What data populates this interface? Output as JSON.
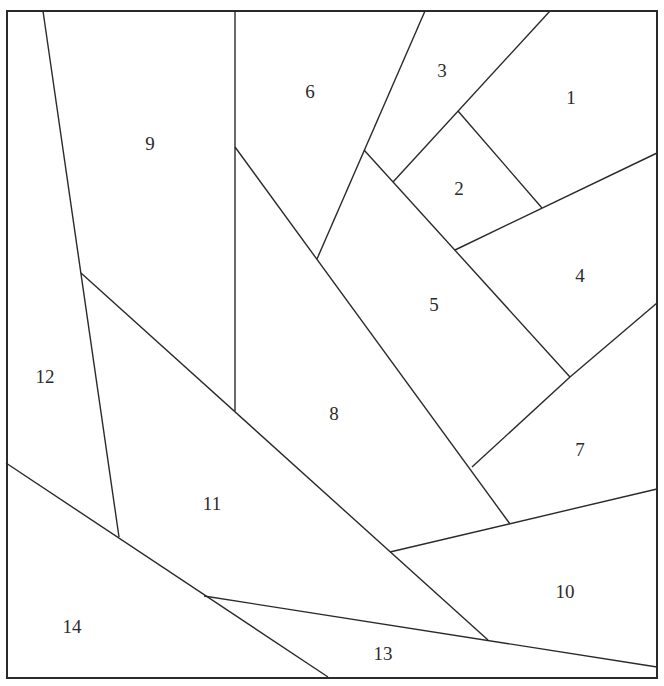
{
  "diagram": {
    "width": 664,
    "height": 686,
    "background_color": "#ffffff",
    "line_color": "#2a2a2a",
    "label_color": "#2b2b2b",
    "border": {
      "x": 7,
      "y": 11,
      "w": 650,
      "h": 667,
      "stroke_width": 2
    },
    "segments": [
      {
        "name": "edge-12-right",
        "x1": 43,
        "y1": 11,
        "x2": 119,
        "y2": 537
      },
      {
        "name": "edge-9-right",
        "x1": 235,
        "y1": 11,
        "x2": 235,
        "y2": 411
      },
      {
        "name": "edge-11-top",
        "x1": 81,
        "y1": 273,
        "x2": 488,
        "y2": 640
      },
      {
        "name": "edge-14-top",
        "x1": 6,
        "y1": 463,
        "x2": 328,
        "y2": 677
      },
      {
        "name": "edge-13-top",
        "x1": 204,
        "y1": 596,
        "x2": 657,
        "y2": 667
      },
      {
        "name": "edge-8-top",
        "x1": 235,
        "y1": 147,
        "x2": 510,
        "y2": 524
      },
      {
        "name": "edge-6-right",
        "x1": 425,
        "y1": 11,
        "x2": 317,
        "y2": 259
      },
      {
        "name": "edge-5-top",
        "x1": 364,
        "y1": 150,
        "x2": 570,
        "y2": 377
      },
      {
        "name": "edge-3-right",
        "x1": 550,
        "y1": 11,
        "x2": 393,
        "y2": 182
      },
      {
        "name": "edge-1-2",
        "x1": 458,
        "y1": 111,
        "x2": 542,
        "y2": 208
      },
      {
        "name": "edge-4-top",
        "x1": 657,
        "y1": 153,
        "x2": 455,
        "y2": 250
      },
      {
        "name": "edge-4-7",
        "x1": 657,
        "y1": 303,
        "x2": 570,
        "y2": 377
      },
      {
        "name": "edge-5-7",
        "x1": 570,
        "y1": 377,
        "x2": 472,
        "y2": 467
      },
      {
        "name": "edge-10-top",
        "x1": 390,
        "y1": 552,
        "x2": 657,
        "y2": 489
      }
    ],
    "regions": [
      {
        "label": "1",
        "x": 571,
        "y": 97
      },
      {
        "label": "2",
        "x": 459,
        "y": 188
      },
      {
        "label": "3",
        "x": 442,
        "y": 70
      },
      {
        "label": "4",
        "x": 580,
        "y": 275
      },
      {
        "label": "5",
        "x": 434,
        "y": 304
      },
      {
        "label": "6",
        "x": 310,
        "y": 91
      },
      {
        "label": "7",
        "x": 580,
        "y": 449
      },
      {
        "label": "8",
        "x": 334,
        "y": 413
      },
      {
        "label": "9",
        "x": 150,
        "y": 143
      },
      {
        "label": "10",
        "x": 565,
        "y": 591
      },
      {
        "label": "11",
        "x": 212,
        "y": 503
      },
      {
        "label": "12",
        "x": 45,
        "y": 376
      },
      {
        "label": "13",
        "x": 383,
        "y": 653
      },
      {
        "label": "14",
        "x": 72,
        "y": 626
      }
    ]
  }
}
